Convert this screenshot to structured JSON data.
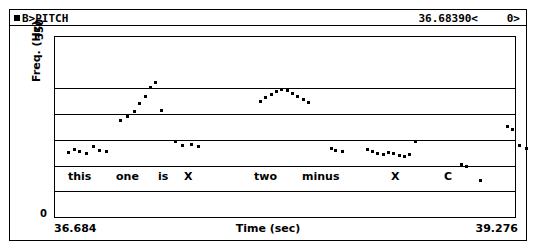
{
  "header": {
    "marker_icon": "square-marker-icon",
    "title": "B>PITCH",
    "cursor_value": "36.68390<",
    "right_value": "0>"
  },
  "axes": {
    "ylabel": "Freq. (Hz)",
    "ytop": "350",
    "ybot": "0",
    "xlabel": "Time (sec)",
    "xmin_label": "36.684",
    "xmax_label": "39.276"
  },
  "transcription": [
    {
      "text": "this",
      "x": 14
    },
    {
      "text": "one",
      "x": 62
    },
    {
      "text": "is",
      "x": 104
    },
    {
      "text": "X",
      "x": 130
    },
    {
      "text": "two",
      "x": 200
    },
    {
      "text": "minus",
      "x": 248
    },
    {
      "text": "X",
      "x": 337
    },
    {
      "text": "C",
      "x": 390
    }
  ],
  "chart_data": {
    "type": "scatter",
    "title": "B>PITCH",
    "xlabel": "Time (sec)",
    "ylabel": "Freq. (Hz)",
    "xlim": [
      36.684,
      39.276
    ],
    "ylim": [
      0,
      350
    ],
    "gridlines_y": [
      250,
      200,
      150,
      100,
      50
    ],
    "grid": true,
    "legend": null,
    "series": [
      {
        "name": "pitch track",
        "x": [
          36.76,
          36.79,
          36.82,
          36.86,
          36.9,
          36.93,
          36.97,
          37.05,
          37.09,
          37.13,
          37.16,
          37.19,
          37.22,
          37.25,
          37.28,
          37.36,
          37.4,
          37.45,
          37.49,
          37.84,
          37.87,
          37.9,
          37.93,
          37.96,
          37.99,
          38.02,
          38.05,
          38.08,
          38.11,
          38.24,
          38.26,
          38.3,
          38.44,
          38.47,
          38.5,
          38.53,
          38.56,
          38.59,
          38.62,
          38.65,
          38.68,
          38.71,
          38.97,
          39.0,
          39.08,
          39.23,
          39.26,
          39.3,
          39.34,
          39.4
        ],
        "y": [
          127,
          133,
          128,
          124,
          138,
          131,
          128,
          188,
          196,
          206,
          221,
          236,
          252,
          263,
          209,
          147,
          140,
          141,
          139,
          226,
          233,
          239,
          245,
          248,
          247,
          241,
          236,
          230,
          224,
          135,
          131,
          128,
          133,
          129,
          124,
          122,
          127,
          124,
          121,
          118,
          122,
          148,
          103,
          100,
          72,
          176,
          171,
          140,
          135,
          73
        ]
      }
    ]
  }
}
